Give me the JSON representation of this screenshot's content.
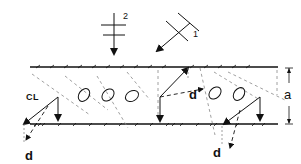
{
  "diagram": {
    "labels": {
      "centerline": "CL",
      "displacement_1": "d",
      "displacement_2": "d",
      "displacement_3": "d",
      "spacing": "a",
      "polarization_2": "2",
      "polarization_1": "1"
    },
    "elements": {
      "top_plane": "upper lattice plane with hatching",
      "bottom_plane": "lower lattice plane with hatching",
      "ellipses_count": 5,
      "wave_arrows": [
        "2: vertical downward propagation",
        "1: diagonal down-left propagation"
      ]
    },
    "colors": {
      "ink": "#111111",
      "dashed": "#888888",
      "background": "#ffffff"
    }
  }
}
